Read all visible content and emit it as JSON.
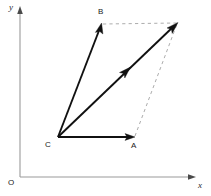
{
  "figure": {
    "kind": "vector-parallelogram-diagram",
    "background_color": "#ffffff",
    "width": 211,
    "height": 196
  },
  "axes": {
    "x_label": "x",
    "y_label": "y",
    "origin_label": "O",
    "axis_color": "#9a9a9a",
    "x_axis": {
      "x1": 20,
      "y1": 177,
      "x2": 196,
      "y2": 177
    },
    "y_axis": {
      "x1": 20,
      "y1": 176,
      "x2": 20,
      "y2": 8
    },
    "x_label_pos": {
      "left": 198,
      "top": 181
    },
    "y_label_pos": {
      "left": 9,
      "top": 4
    },
    "origin_label_pos": {
      "left": 8,
      "top": 179
    }
  },
  "points": {
    "C": {
      "label": "C",
      "x": 58,
      "y": 137,
      "label_left": 45,
      "label_top": 141
    },
    "A": {
      "label": "A",
      "x": 134,
      "y": 137,
      "label_left": 131,
      "label_top": 142
    },
    "B": {
      "label": "B",
      "x": 101,
      "y": 24,
      "label_left": 98,
      "label_top": 8
    },
    "D": {
      "label": "",
      "x": 177,
      "y": 23
    }
  },
  "vectors": [
    {
      "name": "vector-ca",
      "from": "C",
      "to": "A",
      "style": "solid",
      "color": "#111111",
      "arrowhead": "end"
    },
    {
      "name": "vector-cb",
      "from": "C",
      "to": "B",
      "style": "solid",
      "color": "#111111",
      "arrowhead": "end"
    },
    {
      "name": "vector-resultant-cd",
      "from": "C",
      "to": "D",
      "style": "solid",
      "color": "#111111",
      "arrowhead": "end-and-mid",
      "mid_arrow_at": {
        "x": 127,
        "y": 70
      }
    }
  ],
  "construction_lines": [
    {
      "name": "dashed-b-to-d",
      "from": "B",
      "to": "D",
      "style": "dashed",
      "color": "#adadad"
    },
    {
      "name": "dashed-a-to-d",
      "from": "A",
      "to": "D",
      "style": "dashed",
      "color": "#adadad"
    }
  ],
  "colors": {
    "vector": "#111111",
    "dashed": "#adadad",
    "axis": "#9a9a9a",
    "label": "#1a1a1a"
  }
}
